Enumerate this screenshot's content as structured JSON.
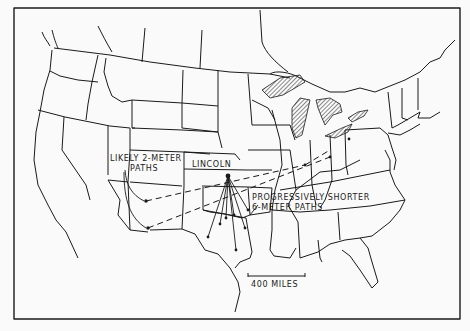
{
  "map": {
    "labels": {
      "city": "LINCOLN",
      "two_meter_line1": "LIKELY 2-METER",
      "two_meter_line2": "PATHS",
      "six_meter_line1": "PROGRESSIVELY SHORTER",
      "six_meter_line2": "6-METER PATHS",
      "scale": "400 MILES"
    },
    "colors": {
      "ink": "#1a1a1a",
      "paper": "#fafafa"
    }
  }
}
